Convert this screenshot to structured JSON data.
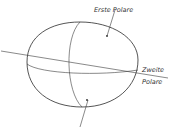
{
  "figure": {
    "labels": {
      "first_polar": "Erste Polare",
      "second_polar_line1": "Zweite",
      "second_polar_line2": "Polare"
    },
    "colors": {
      "stroke": "#2a2a2a",
      "background": "#ffffff"
    }
  }
}
